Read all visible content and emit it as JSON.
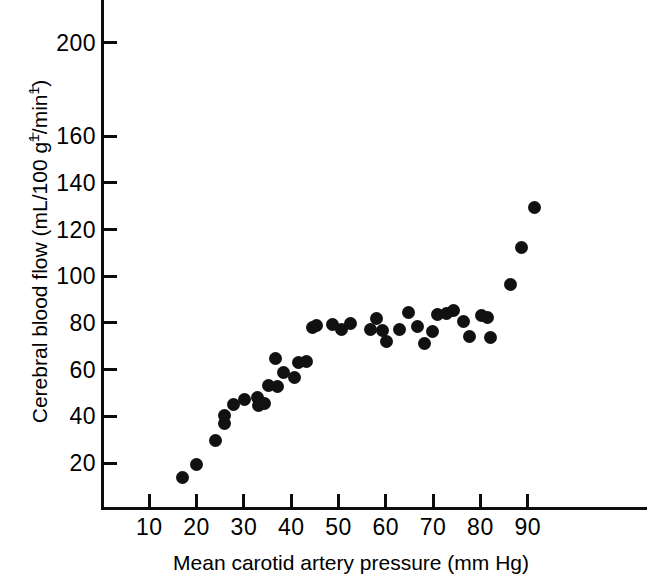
{
  "chart_data": {
    "type": "scatter",
    "title": "",
    "xlabel": "Mean carotid artery pressure (mm Hg)",
    "ylabel": "Cerebral blood flow (mL/100 g⁻¹/min⁻¹)",
    "xlabel_parts": {
      "prefix": "Mean carotid artery pressure (mm Hg)"
    },
    "ylabel_parts": {
      "a": "Cerebral blood flow (mL/100 g",
      "sup1": "–1",
      "b": "/min",
      "sup2": "–1",
      "c": ")"
    },
    "xlim": [
      0,
      115
    ],
    "ylim": [
      0,
      215
    ],
    "xticks": [
      10,
      20,
      30,
      40,
      50,
      60,
      70,
      80,
      90
    ],
    "xtick_labels": [
      "10",
      "20",
      "30",
      "40",
      "50",
      "60",
      "70",
      "80",
      "90"
    ],
    "yticks": [
      20,
      40,
      60,
      80,
      100,
      120,
      140,
      160,
      200
    ],
    "ytick_labels": [
      "20",
      "40",
      "60",
      "80",
      "100",
      "120",
      "140",
      "160",
      "200"
    ],
    "grid": false,
    "legend": false,
    "marker": "filled-circle",
    "marker_color": "#111111",
    "axis_color": "#0d0d0d",
    "background_color": "#ffffff",
    "points": [
      {
        "x": 17.1,
        "y": 13.6
      },
      {
        "x": 19.9,
        "y": 19.4
      },
      {
        "x": 23.9,
        "y": 29.7
      },
      {
        "x": 25.9,
        "y": 37.1
      },
      {
        "x": 25.9,
        "y": 40.5
      },
      {
        "x": 27.9,
        "y": 45.0
      },
      {
        "x": 30.1,
        "y": 47.4
      },
      {
        "x": 32.9,
        "y": 48.2
      },
      {
        "x": 33.0,
        "y": 44.6
      },
      {
        "x": 34.3,
        "y": 45.5
      },
      {
        "x": 35.1,
        "y": 53.0
      },
      {
        "x": 36.7,
        "y": 64.7
      },
      {
        "x": 37.2,
        "y": 52.6
      },
      {
        "x": 38.3,
        "y": 58.6
      },
      {
        "x": 40.6,
        "y": 56.5
      },
      {
        "x": 41.5,
        "y": 62.9
      },
      {
        "x": 43.2,
        "y": 63.3
      },
      {
        "x": 44.4,
        "y": 78.2
      },
      {
        "x": 45.4,
        "y": 79.0
      },
      {
        "x": 48.8,
        "y": 79.5
      },
      {
        "x": 50.6,
        "y": 77.0
      },
      {
        "x": 52.5,
        "y": 79.6
      },
      {
        "x": 56.7,
        "y": 77.1
      },
      {
        "x": 58.1,
        "y": 81.9
      },
      {
        "x": 59.4,
        "y": 76.8
      },
      {
        "x": 60.2,
        "y": 72.0
      },
      {
        "x": 63.0,
        "y": 77.0
      },
      {
        "x": 64.8,
        "y": 84.6
      },
      {
        "x": 66.6,
        "y": 78.4
      },
      {
        "x": 68.1,
        "y": 71.0
      },
      {
        "x": 69.9,
        "y": 76.4
      },
      {
        "x": 70.9,
        "y": 83.8
      },
      {
        "x": 72.9,
        "y": 84.2
      },
      {
        "x": 74.3,
        "y": 85.2
      },
      {
        "x": 76.5,
        "y": 80.8
      },
      {
        "x": 77.6,
        "y": 74.0
      },
      {
        "x": 80.2,
        "y": 83.1
      },
      {
        "x": 81.4,
        "y": 82.4
      },
      {
        "x": 82.2,
        "y": 73.9
      },
      {
        "x": 86.4,
        "y": 96.6
      },
      {
        "x": 88.6,
        "y": 112.5
      },
      {
        "x": 91.4,
        "y": 129.5
      }
    ]
  }
}
